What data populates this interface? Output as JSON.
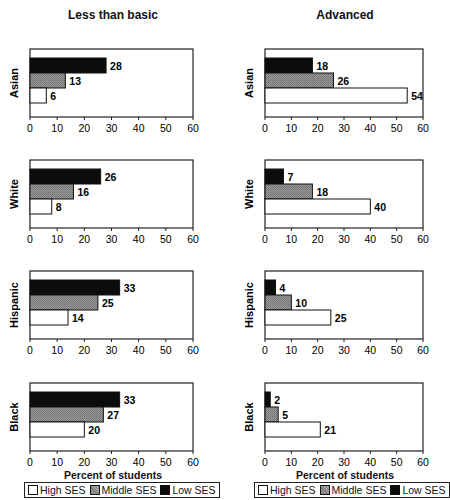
{
  "chart_data": [
    {
      "type": "bar",
      "orientation": "horizontal",
      "title": "Less than basic",
      "xlabel": "Percent of students",
      "xlim": [
        0,
        60
      ],
      "xticks": [
        0,
        10,
        20,
        30,
        40,
        50,
        60
      ],
      "grid": false,
      "legend_position": "bottom",
      "panels": [
        {
          "group": "Asian",
          "series": [
            {
              "name": "Low SES",
              "value": 28
            },
            {
              "name": "Middle SES",
              "value": 13
            },
            {
              "name": "High SES",
              "value": 6
            }
          ]
        },
        {
          "group": "White",
          "series": [
            {
              "name": "Low SES",
              "value": 26
            },
            {
              "name": "Middle SES",
              "value": 16
            },
            {
              "name": "High SES",
              "value": 8
            }
          ]
        },
        {
          "group": "Hispanic",
          "series": [
            {
              "name": "Low SES",
              "value": 33
            },
            {
              "name": "Middle SES",
              "value": 25
            },
            {
              "name": "High SES",
              "value": 14
            }
          ]
        },
        {
          "group": "Black",
          "series": [
            {
              "name": "Low SES",
              "value": 33
            },
            {
              "name": "Middle SES",
              "value": 27
            },
            {
              "name": "High SES",
              "value": 20
            }
          ]
        }
      ]
    },
    {
      "type": "bar",
      "orientation": "horizontal",
      "title": "Advanced",
      "xlabel": "Percent of students",
      "xlim": [
        0,
        60
      ],
      "xticks": [
        0,
        10,
        20,
        30,
        40,
        50,
        60
      ],
      "grid": false,
      "legend_position": "bottom",
      "panels": [
        {
          "group": "Asian",
          "series": [
            {
              "name": "Low SES",
              "value": 18
            },
            {
              "name": "Middle SES",
              "value": 26
            },
            {
              "name": "High SES",
              "value": 54
            }
          ]
        },
        {
          "group": "White",
          "series": [
            {
              "name": "Low SES",
              "value": 7
            },
            {
              "name": "Middle SES",
              "value": 18
            },
            {
              "name": "High SES",
              "value": 40
            }
          ]
        },
        {
          "group": "Hispanic",
          "series": [
            {
              "name": "Low SES",
              "value": 4
            },
            {
              "name": "Middle SES",
              "value": 10
            },
            {
              "name": "High SES",
              "value": 25
            }
          ]
        },
        {
          "group": "Black",
          "series": [
            {
              "name": "Low SES",
              "value": 2
            },
            {
              "name": "Middle SES",
              "value": 5
            },
            {
              "name": "High SES",
              "value": 21
            }
          ]
        }
      ]
    }
  ],
  "columns": [
    {
      "title": "Less than basic",
      "xlabel": "Percent of students"
    },
    {
      "title": "Advanced",
      "xlabel": "Percent of students"
    }
  ],
  "legend": {
    "items": [
      {
        "label": "High SES",
        "key": "high"
      },
      {
        "label": "Middle SES",
        "key": "mid"
      },
      {
        "label": "Low SES",
        "key": "low"
      }
    ]
  },
  "colors": {
    "low": "#0c0c0c",
    "mid": "#8a8a8a",
    "high": "#ffffff",
    "axis": "#222222"
  }
}
